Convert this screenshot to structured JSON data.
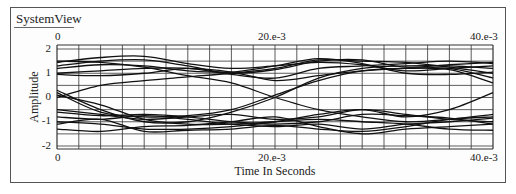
{
  "window": {
    "title": "SystemView"
  },
  "chart_data": {
    "type": "line",
    "title": "",
    "subtitle": "Eye diagram (overlaid traces)",
    "xlabel": "Time In Seconds",
    "ylabel": "Amplitude",
    "xlim": [
      0,
      0.04
    ],
    "ylim": [
      -2,
      2
    ],
    "x_tick_labels_top": [
      "0",
      "20.e-3",
      "40.e-3"
    ],
    "x_tick_labels_bottom": [
      "0",
      "20.e-3",
      "40.e-3"
    ],
    "y_tick_labels": [
      "2",
      "1",
      "0",
      "-1",
      "-2"
    ],
    "grid": true,
    "grid_x_divisions": 20,
    "grid_y_step": 0.5,
    "legend": null,
    "x": [
      0,
      0.004,
      0.008,
      0.012,
      0.016,
      0.02,
      0.024,
      0.028,
      0.032,
      0.036,
      0.04
    ],
    "series": [
      {
        "name": "trace-1",
        "values": [
          1.45,
          1.65,
          1.7,
          1.4,
          1.2,
          1.3,
          1.45,
          1.35,
          1.1,
          1.2,
          1.3
        ]
      },
      {
        "name": "trace-2",
        "values": [
          1.3,
          1.5,
          1.55,
          1.3,
          1.0,
          1.15,
          1.5,
          1.55,
          1.25,
          1.35,
          1.45
        ]
      },
      {
        "name": "trace-3",
        "values": [
          1.2,
          1.35,
          1.3,
          1.1,
          1.05,
          1.3,
          1.6,
          1.4,
          1.0,
          0.95,
          1.05
        ]
      },
      {
        "name": "trace-4",
        "values": [
          1.0,
          1.1,
          1.2,
          1.2,
          0.95,
          0.8,
          1.2,
          1.3,
          1.4,
          1.5,
          1.4
        ]
      },
      {
        "name": "trace-5",
        "values": [
          0.95,
          0.9,
          1.0,
          1.2,
          1.05,
          0.7,
          0.9,
          1.1,
          1.2,
          1.2,
          0.8
        ]
      },
      {
        "name": "trace-6",
        "values": [
          1.5,
          1.45,
          1.25,
          0.9,
          0.6,
          0.0,
          -0.5,
          -0.8,
          -1.0,
          -0.9,
          -0.7
        ]
      },
      {
        "name": "trace-7",
        "values": [
          0.0,
          0.5,
          0.7,
          0.85,
          1.0,
          1.2,
          1.55,
          1.5,
          1.45,
          1.25,
          1.0
        ]
      },
      {
        "name": "trace-8",
        "values": [
          0.2,
          -0.6,
          -0.8,
          -0.75,
          -0.5,
          0.1,
          0.7,
          1.1,
          1.2,
          1.15,
          0.6
        ]
      },
      {
        "name": "trace-9",
        "values": [
          0.3,
          -0.5,
          -1.0,
          -1.0,
          -0.6,
          0.0,
          0.8,
          1.2,
          1.3,
          1.3,
          1.2
        ]
      },
      {
        "name": "trace-10",
        "values": [
          -0.5,
          -0.7,
          -0.9,
          -0.8,
          -0.7,
          -0.9,
          -0.8,
          -0.5,
          -0.7,
          -0.9,
          -1.0
        ]
      },
      {
        "name": "trace-11",
        "values": [
          -0.6,
          -0.75,
          -0.7,
          -0.8,
          -1.0,
          -1.1,
          -1.0,
          -0.7,
          -0.75,
          -0.85,
          -1.1
        ]
      },
      {
        "name": "trace-12",
        "values": [
          -0.8,
          -0.9,
          -0.75,
          -0.9,
          -1.1,
          -1.2,
          -1.1,
          -1.3,
          -1.1,
          -1.0,
          -0.85
        ]
      },
      {
        "name": "trace-13",
        "values": [
          -1.0,
          -1.1,
          -1.3,
          -1.3,
          -1.2,
          -1.0,
          -0.7,
          -0.5,
          -0.8,
          -0.5,
          0.2
        ]
      },
      {
        "name": "trace-14",
        "values": [
          -1.3,
          -1.4,
          -1.2,
          -1.15,
          -1.0,
          -0.8,
          -1.2,
          -1.5,
          -1.3,
          -1.2,
          -1.1
        ]
      },
      {
        "name": "trace-15",
        "values": [
          -1.1,
          -0.9,
          -1.4,
          -1.35,
          -1.3,
          -1.15,
          -1.3,
          -1.4,
          -1.2,
          -0.9,
          -0.8
        ]
      },
      {
        "name": "trace-16",
        "values": [
          0.1,
          -0.3,
          -0.9,
          -1.1,
          -1.1,
          -1.0,
          -0.9,
          -1.0,
          -1.1,
          -1.3,
          -1.35
        ]
      }
    ]
  },
  "colors": {
    "trace": "#111111",
    "grid": "#333333",
    "frame": "#555555"
  }
}
